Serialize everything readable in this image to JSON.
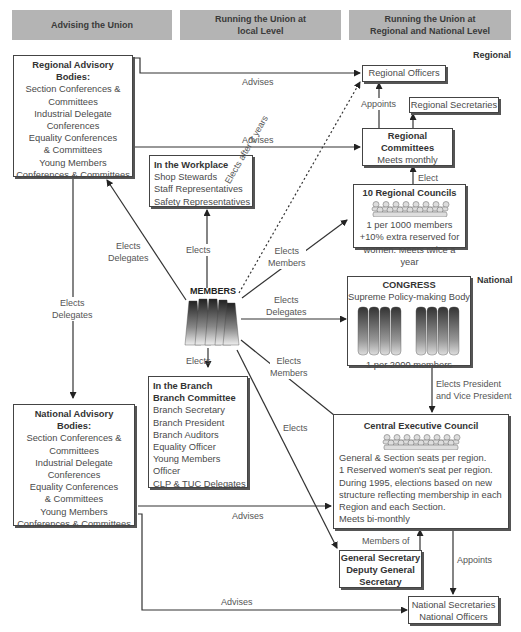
{
  "headers": {
    "col1": "Advising the Union",
    "col2_line1": "Running the Union at",
    "col2_line2": "local Level",
    "col3_line1": "Running the Union at",
    "col3_line2": "Regional and National Level"
  },
  "levels": {
    "regional": "Regional",
    "national": "National"
  },
  "regional_advisory": {
    "title1": "Regional Advisory",
    "title2": "Bodies:",
    "lines": [
      "Section Conferences &",
      "Committees",
      "Industrial Delegate",
      "Conferences",
      "Equality Conferences",
      "& Committees",
      "Young Members",
      "Conferences & Committees"
    ]
  },
  "national_advisory": {
    "title1": "National Advisory",
    "title2": "Bodies:",
    "lines": [
      "Section Conferences &",
      "Committees",
      "Industrial Delegate",
      "Conferences",
      "Equality Conferences",
      "& Committees",
      "Young Members",
      "Conferences & Committees"
    ]
  },
  "workplace": {
    "title": "In the Workplace",
    "lines": [
      "Shop Stewards",
      "Staff Representatives",
      "Safety Representatives"
    ]
  },
  "branch": {
    "title1": "In the Branch",
    "title2": "Branch Committee",
    "lines": [
      "Branch Secretary",
      "Branch President",
      "Branch Auditors",
      "Equality Officer",
      "Young Members",
      "Officer",
      "CLP & TUC Delegates"
    ]
  },
  "members": {
    "title": "MEMBERS"
  },
  "regional_officers": {
    "title": "Regional Officers"
  },
  "regional_secretaries": {
    "title": "Regional Secretaries"
  },
  "regional_committees": {
    "title1": "Regional",
    "title2": "Committees",
    "sub": "Meets monthly"
  },
  "regional_councils": {
    "title": "10 Regional Councils",
    "lines": [
      "1 per 1000 members",
      "+10% extra reserved for",
      "women. Meets twice a year"
    ]
  },
  "congress": {
    "title": "CONGRESS",
    "sub": "Supreme Policy-making Body",
    "footer": "1 per 2000 members"
  },
  "cec": {
    "title": "Central Executive Council",
    "lines": [
      "General & Section seats per region.",
      "1 Reserved women's seat per region.",
      "During 1995, elections based on new",
      "structure reflecting membership in each",
      "Region and each Section.",
      "Meets bi-monthly"
    ]
  },
  "gen_sec": {
    "lines": [
      "General Secretary",
      "Deputy General",
      "Secretary"
    ]
  },
  "national_secretaries": {
    "lines": [
      "National Secretaries",
      "National Officers"
    ]
  },
  "labels": {
    "advises1": "Advises",
    "advises2": "Advises",
    "advises3": "Advises",
    "advises4": "Advises",
    "appoints1": "Appoints",
    "appoints2": "Appoints",
    "elect": "Elect",
    "elects_after": "Elects after 2 years",
    "elects_workplace": "Elects",
    "elects_delegates_l1": "Elects",
    "elects_delegates_l2": "Delegates",
    "elects_delegates2_l1": "Elects",
    "elects_delegates2_l2": "Delegates",
    "elects_members1_l1": "Elects",
    "elects_members1_l2": "Members",
    "elects_delegates3_l1": "Elects",
    "elects_delegates3_l2": "Delegates",
    "elects_members2_l1": "Elects",
    "elects_members2_l2": "Members",
    "elects_branch": "Elects",
    "elects_gs": "Elects",
    "elects_president_l1": "Elects President",
    "elects_president_l2": "and Vice President",
    "members_of": "Members of"
  }
}
